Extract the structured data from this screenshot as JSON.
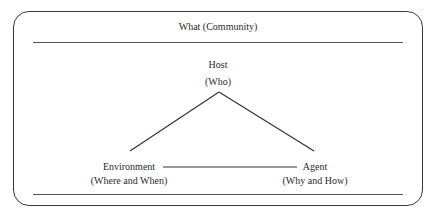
{
  "diagram": {
    "title": "What (Community)",
    "nodes": {
      "host": {
        "label": "Host",
        "sublabel": "(Who)"
      },
      "environment": {
        "label": "Environment",
        "sublabel": "(Where and When)"
      },
      "agent": {
        "label": "Agent",
        "sublabel": "(Why and How)"
      }
    },
    "edges": [
      {
        "from": "host",
        "to": "environment"
      },
      {
        "from": "host",
        "to": "agent"
      },
      {
        "from": "environment",
        "to": "agent"
      }
    ],
    "colors": {
      "stroke": "#333333",
      "text": "#2a2a2a",
      "background": "#ffffff"
    }
  }
}
